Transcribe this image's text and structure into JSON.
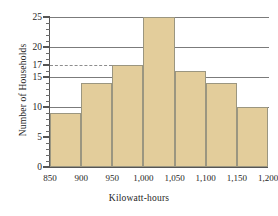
{
  "chart_data": {
    "type": "bar",
    "title": "",
    "subtitle": "",
    "xlabel": "Kilowatt-hours",
    "ylabel": "Number of Households",
    "categories": [
      "850-900",
      "900-950",
      "950-1,000",
      "1,000-1,050",
      "1,050-1,100",
      "1,100-1,150",
      "1,150-1,200"
    ],
    "bin_edges": [
      850,
      900,
      950,
      1000,
      1050,
      1100,
      1150,
      1200
    ],
    "values": [
      9,
      14,
      17,
      25,
      16,
      14,
      10
    ],
    "xlim": [
      850,
      1200
    ],
    "ylim": [
      0,
      25
    ],
    "x_tick_labels": [
      "850",
      "900",
      "950",
      "1,000",
      "1,050",
      "1,100",
      "1,150",
      "1,200"
    ],
    "x_tick_values": [
      850,
      900,
      950,
      1000,
      1050,
      1100,
      1150,
      1200
    ],
    "y_tick_labels": [
      "0",
      "5",
      "10",
      "15",
      "17",
      "20",
      "25"
    ],
    "y_tick_values": [
      0,
      5,
      10,
      15,
      17,
      20,
      25
    ],
    "y_minor_tick_step": 1,
    "gridlines": [
      10,
      15,
      20,
      25
    ],
    "grid": true,
    "legend": null,
    "annotations": [
      {
        "type": "reference-line",
        "style": "dashed",
        "value": 17,
        "label": "17",
        "extends_to_bin": "950-1,000"
      }
    ],
    "bar_fill_color": "#e3cd9b",
    "bar_edge_color": "#9b9680",
    "grid_color": "#7b7b7b",
    "axis_color": "#555555",
    "background_color": "#ffffff"
  }
}
